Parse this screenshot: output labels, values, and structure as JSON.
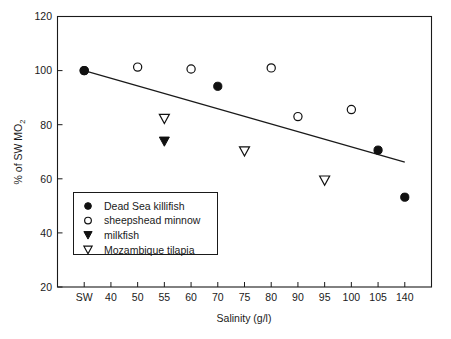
{
  "chart_data": {
    "type": "scatter",
    "title": "",
    "xlabel": "Salinity (g/l)",
    "ylabel": "% of SW MO2",
    "ylabel_main": "% of SW MO",
    "ylabel_subscript": "2",
    "categories": [
      "SW",
      "40",
      "50",
      "55",
      "60",
      "70",
      "75",
      "80",
      "90",
      "95",
      "100",
      "105",
      "140"
    ],
    "ylim": [
      20,
      120
    ],
    "yticks": [
      20,
      40,
      60,
      80,
      100,
      120
    ],
    "ytick_labels": [
      "20",
      "40",
      "60",
      "80",
      "100",
      "120"
    ],
    "grid": false,
    "legend_position": "lower-left-inside",
    "series": [
      {
        "name": "Dead Sea killifish",
        "marker": "filled-circle",
        "color": "#111111",
        "points": [
          {
            "x": "SW",
            "y": 100.0
          },
          {
            "x": "70",
            "y": 94.2
          },
          {
            "x": "105",
            "y": 70.6
          },
          {
            "x": "140",
            "y": 53.2
          }
        ]
      },
      {
        "name": "sheepshead minnow",
        "marker": "open-circle",
        "color": "#111111",
        "points": [
          {
            "x": "SW",
            "y": 100.0
          },
          {
            "x": "50",
            "y": 101.3
          },
          {
            "x": "60",
            "y": 100.6
          },
          {
            "x": "80",
            "y": 101.0
          },
          {
            "x": "90",
            "y": 83.0
          },
          {
            "x": "100",
            "y": 85.6
          }
        ]
      },
      {
        "name": "milkfish",
        "marker": "filled-triangle-down",
        "color": "#111111",
        "points": [
          {
            "x": "55",
            "y": 73.8
          }
        ]
      },
      {
        "name": "Mozambique tilapia",
        "marker": "open-triangle-down",
        "color": "#111111",
        "points": [
          {
            "x": "55",
            "y": 82.2
          },
          {
            "x": "75",
            "y": 70.2
          },
          {
            "x": "95",
            "y": 59.4
          }
        ]
      }
    ],
    "trend_line": {
      "name": "regression line",
      "from": {
        "x": "SW",
        "y": 100.0
      },
      "to": {
        "x": "140",
        "y": 66.2
      }
    },
    "legend_entries": [
      {
        "label": "Dead Sea killifish",
        "marker": "filled-circle"
      },
      {
        "label": "sheepshead minnow",
        "marker": "open-circle"
      },
      {
        "label": "milkfish",
        "marker": "filled-triangle-down"
      },
      {
        "label": "Mozambique tilapia",
        "marker": "open-triangle-down"
      }
    ]
  }
}
